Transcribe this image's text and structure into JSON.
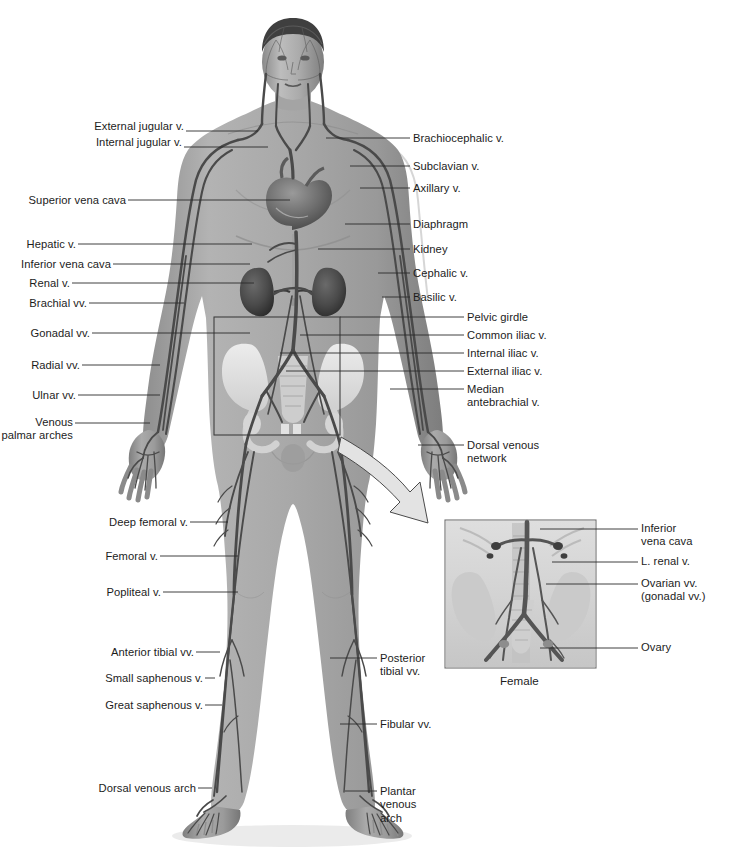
{
  "figure": {
    "subject_caption": "Female",
    "background_color": "#ffffff",
    "text_color": "#1c1c1c",
    "leader_color": "#2b2b2b"
  },
  "labels_left": [
    {
      "id": "external-jugular-v",
      "text": "External jugular v.",
      "x": 98,
      "y": 126,
      "line_to_x": 258,
      "line_y": 131
    },
    {
      "id": "internal-jugular-v",
      "text": "Internal jugular v.",
      "x": 104,
      "y": 142,
      "line_to_x": 268,
      "line_y": 147
    },
    {
      "id": "superior-vena-cava",
      "text": "Superior vena cava",
      "x": 27,
      "y": 195,
      "line_to_x": 290,
      "line_y": 200
    },
    {
      "id": "hepatic-v",
      "text": "Hepatic v.",
      "x": 27,
      "y": 239,
      "line_to_x": 252,
      "line_y": 244
    },
    {
      "id": "inferior-vena-cava",
      "text": "Inferior vena cava",
      "x": 27,
      "y": 259,
      "line_to_x": 250,
      "line_y": 264
    },
    {
      "id": "renal-v",
      "text": "Renal v.",
      "x": 27,
      "y": 278,
      "line_to_x": 254,
      "line_y": 283
    },
    {
      "id": "brachial-vv",
      "text": "Brachial vv.",
      "x": 27,
      "y": 298,
      "line_to_x": 184,
      "line_y": 303
    },
    {
      "id": "gonadal-vv",
      "text": "Gonadal vv.",
      "x": 27,
      "y": 328,
      "line_to_x": 250,
      "line_y": 333
    },
    {
      "id": "radial-vv",
      "text": "Radial vv.",
      "x": 27,
      "y": 360,
      "line_to_x": 160,
      "line_y": 365
    },
    {
      "id": "ulnar-vv",
      "text": "Ulnar vv.",
      "x": 27,
      "y": 390,
      "line_to_x": 160,
      "line_y": 395
    },
    {
      "id": "venous-palmar-arches",
      "text": "Venous\npalmar arches",
      "x": 27,
      "y": 418,
      "line_to_x": 150,
      "line_y": 423
    },
    {
      "id": "deep-femoral-v",
      "text": "Deep femoral v.",
      "x": 100,
      "y": 517,
      "line_to_x": 228,
      "line_y": 522
    },
    {
      "id": "femoral-v",
      "text": "Femoral v.",
      "x": 100,
      "y": 551,
      "line_to_x": 238,
      "line_y": 556
    },
    {
      "id": "popliteal-v",
      "text": "Popliteal v.",
      "x": 100,
      "y": 587,
      "line_to_x": 238,
      "line_y": 592
    },
    {
      "id": "anterior-tibial-vv",
      "text": "Anterior tibial vv.",
      "x": 100,
      "y": 647,
      "line_to_x": 220,
      "line_y": 652
    },
    {
      "id": "small-saphenous-v",
      "text": "Small saphenous v.",
      "x": 100,
      "y": 673,
      "line_to_x": 215,
      "line_y": 678
    },
    {
      "id": "great-saphenous-v",
      "text": "Great saphenous v.",
      "x": 100,
      "y": 700,
      "line_to_x": 222,
      "line_y": 705
    },
    {
      "id": "dorsal-venous-arch",
      "text": "Dorsal venous arch",
      "x": 100,
      "y": 783,
      "line_to_x": 212,
      "line_y": 788
    }
  ],
  "labels_right": [
    {
      "id": "brachiocephalic-v",
      "text": "Brachiocephalic v.",
      "x": 413,
      "y": 133,
      "line_from_x": 326,
      "line_y": 138
    },
    {
      "id": "subclavian-v",
      "text": "Subclavian v.",
      "x": 413,
      "y": 161,
      "line_from_x": 350,
      "line_y": 166
    },
    {
      "id": "axillary-v",
      "text": "Axillary v.",
      "x": 413,
      "y": 183,
      "line_from_x": 360,
      "line_y": 188
    },
    {
      "id": "diaphragm",
      "text": "Diaphragm",
      "x": 413,
      "y": 219,
      "line_from_x": 345,
      "line_y": 224
    },
    {
      "id": "kidney",
      "text": "Kidney",
      "x": 413,
      "y": 244,
      "line_from_x": 318,
      "line_y": 249
    },
    {
      "id": "cephalic-v",
      "text": "Cephalic v.",
      "x": 413,
      "y": 268,
      "line_from_x": 378,
      "line_y": 273
    },
    {
      "id": "basilic-v",
      "text": "Basilic v.",
      "x": 413,
      "y": 292,
      "line_from_x": 382,
      "line_y": 297
    },
    {
      "id": "pelvic-girdle",
      "text": "Pelvic girdle",
      "x": 467,
      "y": 312,
      "line_from_x": 340,
      "line_y": 317
    },
    {
      "id": "common-iliac-v",
      "text": "Common iliac v.",
      "x": 467,
      "y": 330,
      "line_from_x": 300,
      "line_y": 335
    },
    {
      "id": "internal-iliac-v",
      "text": "Internal iliac v.",
      "x": 467,
      "y": 348,
      "line_from_x": 280,
      "line_y": 353
    },
    {
      "id": "external-iliac-v",
      "text": "External iliac v.",
      "x": 467,
      "y": 366,
      "line_from_x": 286,
      "line_y": 371
    },
    {
      "id": "median-antebrachial-v",
      "text": "Median\nantebrachial v.",
      "x": 467,
      "y": 384,
      "line_from_x": 390,
      "line_y": 389
    },
    {
      "id": "dorsal-venous-network",
      "text": "Dorsal venous\nnetwork",
      "x": 467,
      "y": 440,
      "line_from_x": 418,
      "line_y": 445
    },
    {
      "id": "posterior-tibial-vv",
      "text": "Posterior\ntibial vv.",
      "x": 380,
      "y": 653,
      "line_from_x": 330,
      "line_y": 658
    },
    {
      "id": "fibular-vv",
      "text": "Fibular vv.",
      "x": 380,
      "y": 719,
      "line_from_x": 340,
      "line_y": 724
    },
    {
      "id": "plantar-venous-arch",
      "text": "Plantar\nvenous\narch",
      "x": 380,
      "y": 786,
      "line_from_x": 345,
      "line_y": 791
    }
  ],
  "inset": {
    "caption": "Female",
    "caption_x": 500,
    "caption_y": 675,
    "frame": {
      "x": 445,
      "y": 520,
      "width": 151,
      "height": 148
    },
    "labels": [
      {
        "id": "inset-inferior-vena-cava",
        "text": "Inferior\nvena cava",
        "x": 641,
        "y": 523,
        "line_from_x": 540,
        "line_y": 529
      },
      {
        "id": "inset-l-renal-v",
        "text": "L. renal v.",
        "x": 641,
        "y": 556,
        "line_from_x": 552,
        "line_y": 562
      },
      {
        "id": "inset-ovarian-vv",
        "text": "Ovarian vv.\n(gonadal vv.)",
        "x": 641,
        "y": 578,
        "line_from_x": 546,
        "line_y": 584
      },
      {
        "id": "inset-ovary",
        "text": "Ovary",
        "x": 641,
        "y": 643,
        "line_from_x": 540,
        "line_y": 648
      }
    ]
  },
  "callout_box": {
    "x": 214,
    "y": 317,
    "width": 126,
    "height": 118
  },
  "zoom_arrow": {
    "from_x": 340,
    "from_y": 437,
    "to_x": 448,
    "to_y": 523
  }
}
